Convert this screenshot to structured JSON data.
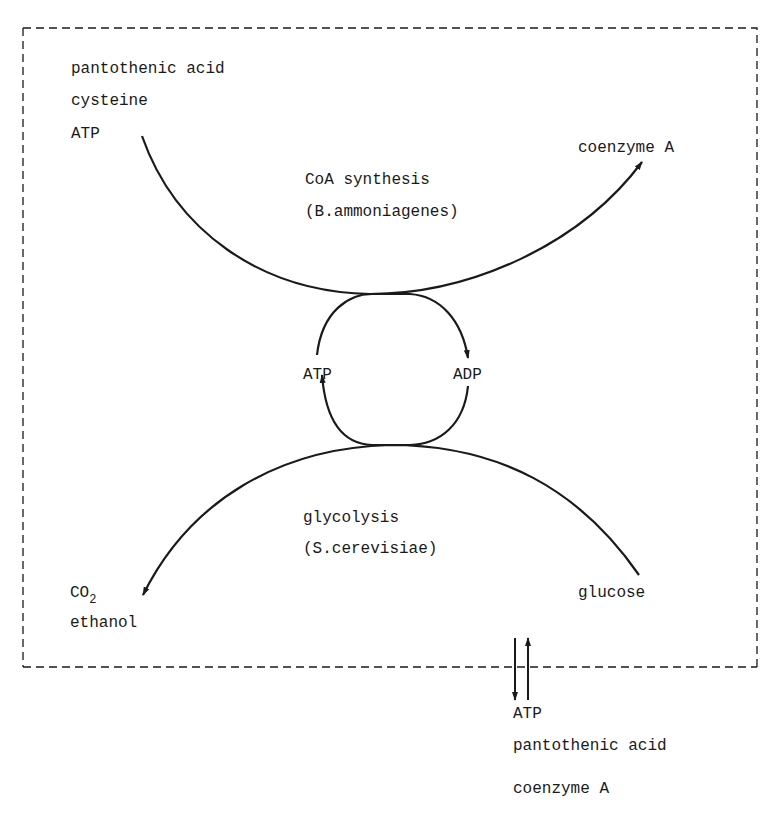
{
  "diagram": {
    "colors": {
      "stroke": "#1a1a1a",
      "background": "#ffffff",
      "text": "#1a1a1a"
    },
    "boundary": {
      "style": "dashed",
      "label": ""
    },
    "inputs_top_left": [
      "pantothenic acid",
      "cysteine",
      "ATP"
    ],
    "output_top_right": "coenzyme A",
    "upper_process": {
      "name": "CoA synthesis",
      "organism": "(B.ammoniagenes)"
    },
    "cycle": {
      "left": "ATP",
      "right": "ADP"
    },
    "lower_process": {
      "name": "glycolysis",
      "organism": "(S.cerevisiae)"
    },
    "output_bottom_left": {
      "line1_main": "CO",
      "line1_sub": "2",
      "line2": "ethanol"
    },
    "input_bottom_right": "glucose",
    "external": [
      "ATP",
      "pantothenic acid",
      "coenzyme A"
    ]
  }
}
